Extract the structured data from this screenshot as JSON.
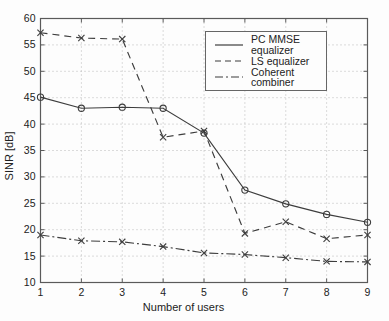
{
  "figure": {
    "colors": {
      "background": "#fdfdfd",
      "frame": "#5a5a5a",
      "grid": "#b9b9b9",
      "line": "#3d3d3d",
      "text": "#222222"
    }
  },
  "chart_data": {
    "type": "line",
    "title": "",
    "xlabel": "Number of users",
    "ylabel": "SINR [dB]",
    "xlim": [
      1,
      9
    ],
    "ylim": [
      10,
      60
    ],
    "xticks": [
      1,
      2,
      3,
      4,
      5,
      6,
      7,
      8,
      9
    ],
    "yticks": [
      10,
      15,
      20,
      25,
      30,
      35,
      40,
      45,
      50,
      55,
      60
    ],
    "grid": true,
    "legend_position": "inside upper right",
    "x": [
      1,
      2,
      3,
      4,
      5,
      6,
      7,
      8,
      9
    ],
    "series": [
      {
        "name": "PC MMSE equalizer",
        "line_style": "solid",
        "marker": "circle",
        "values": [
          45.1,
          43.0,
          43.2,
          43.0,
          38.3,
          27.5,
          24.9,
          22.9,
          21.4
        ]
      },
      {
        "name": "LS equalizer",
        "line_style": "dashed",
        "marker": "x",
        "values": [
          57.3,
          56.3,
          56.1,
          37.5,
          38.7,
          19.3,
          21.5,
          18.3,
          19.0
        ]
      },
      {
        "name": "Coherent combiner",
        "line_style": "dashdot",
        "marker": "x",
        "values": [
          19.0,
          17.9,
          17.7,
          16.8,
          15.6,
          15.3,
          14.7,
          14.0,
          13.9
        ]
      }
    ]
  }
}
